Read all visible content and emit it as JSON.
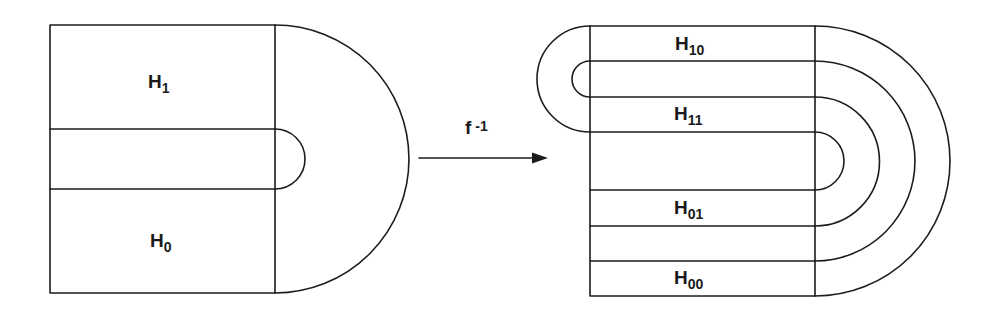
{
  "diagram": {
    "left_figure": {
      "regions": [
        {
          "id": "H1",
          "base": "H",
          "subscript": "1"
        },
        {
          "id": "H0",
          "base": "H",
          "subscript": "0"
        }
      ]
    },
    "map": {
      "label_base": "f",
      "label_exponent": "-1",
      "direction": "left-to-right"
    },
    "right_figure": {
      "regions": [
        {
          "id": "H10",
          "base": "H",
          "subscript": "10"
        },
        {
          "id": "H11",
          "base": "H",
          "subscript": "11"
        },
        {
          "id": "H01",
          "base": "H",
          "subscript": "01"
        },
        {
          "id": "H00",
          "base": "H",
          "subscript": "00"
        }
      ]
    },
    "colors": {
      "ink": "#1c1c1c",
      "background": "#ffffff"
    }
  }
}
